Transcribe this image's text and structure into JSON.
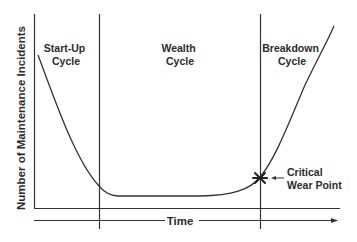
{
  "diagram": {
    "type": "bathtub-curve",
    "y_axis_label": "Number of Maintenance Incidents",
    "x_axis_label": "Time",
    "phases": [
      {
        "line1": "Start-Up",
        "line2": "Cycle"
      },
      {
        "line1": "Wealth",
        "line2": "Cycle"
      },
      {
        "line1": "Breakdown",
        "line2": "Cycle"
      }
    ],
    "annotation": {
      "line1": "Critical",
      "line2": "Wear Point",
      "marker": "asterisk-marker"
    },
    "colors": {
      "line": "#333333",
      "text": "#2b2b2b",
      "background": "#ffffff"
    }
  }
}
